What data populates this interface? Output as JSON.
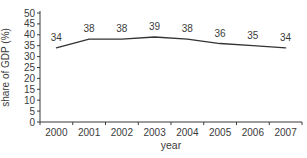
{
  "chart_data": {
    "type": "line",
    "categories": [
      "2000",
      "2001",
      "2002",
      "2003",
      "2004",
      "2005",
      "2006",
      "2007"
    ],
    "values": [
      34,
      38,
      38,
      39,
      38,
      36,
      35,
      34
    ],
    "data_labels": [
      "34",
      "38",
      "38",
      "39",
      "38",
      "36",
      "35",
      "34"
    ],
    "title": "",
    "xlabel": "year",
    "ylabel": "share of GDP (%)",
    "ylim": [
      0,
      50
    ],
    "ytick_step": 5,
    "grid": false,
    "legend": "none",
    "line_color": "#333333",
    "axis_color": "#3b3b3b",
    "text_color": "#3b3b3b",
    "background": "#ffffff"
  }
}
